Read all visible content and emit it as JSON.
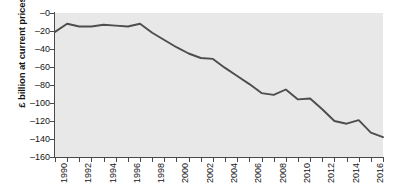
{
  "figure": {
    "clipped_title": "",
    "plot_background": "#e8e8e8",
    "axis_color": "#4a4a4a",
    "line_color": "#4d4d4d"
  },
  "chart_data": {
    "type": "line",
    "title": "",
    "xlabel": "",
    "ylabel": "£ billion at current prices",
    "grid": false,
    "legend": "none",
    "xlim": [
      1990,
      2017
    ],
    "ylim": [
      -160,
      0
    ],
    "ytick_labels": [
      "–0",
      "–20",
      "–40",
      "–60",
      "–80",
      "–100",
      "–120",
      "–140",
      "–160"
    ],
    "ytick_values": [
      0,
      -20,
      -40,
      -60,
      -80,
      -100,
      -120,
      -140,
      -160
    ],
    "xtick_labels": [
      "1990",
      "1992",
      "1994",
      "1996",
      "1998",
      "2000",
      "2002",
      "2004",
      "2006",
      "2008",
      "2010",
      "2012",
      "2014",
      "2016"
    ],
    "xtick_values": [
      1990,
      1992,
      1994,
      1996,
      1998,
      2000,
      2002,
      2004,
      2006,
      2008,
      2010,
      2012,
      2014,
      2016
    ],
    "x": [
      1990,
      1991,
      1992,
      1993,
      1994,
      1995,
      1996,
      1997,
      1998,
      1999,
      2000,
      2001,
      2002,
      2003,
      2004,
      2005,
      2006,
      2007,
      2008,
      2009,
      2010,
      2011,
      2012,
      2013,
      2014,
      2015,
      2016,
      2017
    ],
    "values": [
      -21,
      -12,
      -15,
      -15,
      -13,
      -14,
      -15,
      -12,
      -22,
      -30,
      -38,
      -45,
      -50,
      -51,
      -61,
      -70,
      -79,
      -89,
      -91,
      -85,
      -96,
      -95,
      -107,
      -120,
      -123,
      -119,
      -133,
      -138
    ],
    "series": [
      {
        "name": "Trade balance",
        "values": [
          -21,
          -12,
          -15,
          -15,
          -13,
          -14,
          -15,
          -12,
          -22,
          -30,
          -38,
          -45,
          -50,
          -51,
          -61,
          -70,
          -79,
          -89,
          -91,
          -85,
          -96,
          -95,
          -107,
          -120,
          -123,
          -119,
          -133,
          -138
        ]
      }
    ]
  }
}
